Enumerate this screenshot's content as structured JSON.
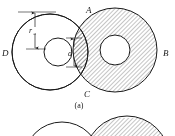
{
  "figure": {
    "labels": {
      "point_a": "A",
      "point_b": "B",
      "point_c": "C",
      "point_d": "D",
      "radius": "r",
      "radius_subscript": "a",
      "gap": "d"
    },
    "captions": {
      "panel_a": "(a)"
    },
    "colors": {
      "stroke": "#1a1a1a",
      "hatch": "#3a3a3a",
      "background": "#ffffff"
    },
    "geometry": {
      "panel_a": {
        "left_circle": {
          "cx": 50,
          "cy": 52,
          "r": 38,
          "hatched": false
        },
        "left_hole": {
          "cx": 58,
          "cy": 52,
          "r": 14
        },
        "right_circle": {
          "cx": 115,
          "cy": 50,
          "r": 42,
          "hatched": true
        },
        "right_hole": {
          "cx": 115,
          "cy": 50,
          "r": 15
        },
        "intersection_top": {
          "x": 88,
          "y": 17
        },
        "intersection_bottom": {
          "x": 88,
          "y": 85
        }
      },
      "panel_b": {
        "left_circle": {
          "cx": 62,
          "cy": 160,
          "r": 38,
          "hatched": false
        },
        "right_circle": {
          "cx": 127,
          "cy": 158,
          "r": 42,
          "hatched": true
        }
      }
    },
    "hatch": {
      "angle_deg": 45,
      "spacing_px": 3
    }
  }
}
